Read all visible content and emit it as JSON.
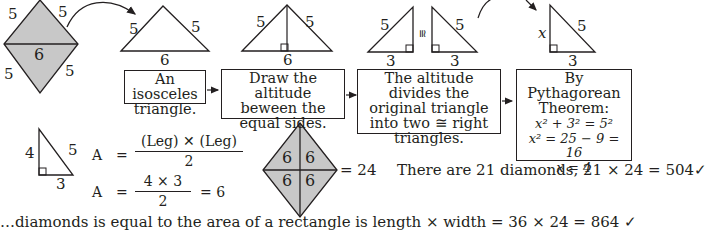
{
  "colors": {
    "ink": "#231f20",
    "fill": "#c8c8c8",
    "background": "#ffffff"
  },
  "diamond_top_left": {
    "side_labels": [
      "5",
      "5",
      "5",
      "5"
    ],
    "diagonal_label": "6"
  },
  "steps": [
    {
      "triangle_labels": {
        "left": "5",
        "right": "5",
        "base": "6"
      },
      "caption": "An isosceles triangle."
    },
    {
      "triangle_labels": {
        "left": "5",
        "right": "5",
        "base": "6"
      },
      "caption": "Draw the altitude beween the equal sides."
    },
    {
      "triangle_labels": {
        "left_hyp": "5",
        "left_base": "3",
        "congruent": "≅",
        "right_hyp": "5",
        "right_base": "3"
      },
      "caption": "The altitude divides the original triangle into two ≅ right triangles."
    },
    {
      "triangle_labels": {
        "leg": "x",
        "hyp": "5",
        "base": "3"
      },
      "caption_title": "By Pythagorean Theorem:",
      "equations": [
        "x² + 3² = 5²",
        "x² = 25 − 9 = 16",
        "x = 4"
      ]
    }
  ],
  "area_section": {
    "triangle_labels": {
      "leg_vertical": "4",
      "hyp": "5",
      "leg_base": "3"
    },
    "formula1": {
      "lhs": "A",
      "eq": "=",
      "numerator": "(Leg) ✕ (Leg)",
      "denominator": "2"
    },
    "formula2": {
      "lhs": "A",
      "eq": "=",
      "numerator": "4 × 3",
      "denominator": "2",
      "result": "= 6"
    }
  },
  "diamond_area": {
    "cell_values": [
      "6",
      "6",
      "6",
      "6"
    ],
    "total": "=  24"
  },
  "summary": "There are 21 diamonds, 21 × 24 = 504✓",
  "bottom_line": "…diamonds is equal to the area of a rectangle is length × width = 36 × 24 = 864 ✓"
}
